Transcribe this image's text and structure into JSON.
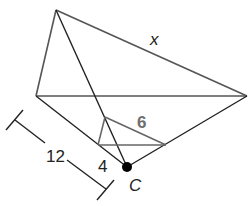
{
  "diagram": {
    "type": "geometry-dilation",
    "colors": {
      "large_triangle_stroke": "#555555",
      "small_triangle_stroke": "#666666",
      "ray_stroke": "#222222",
      "label_dark": "#222222",
      "label_gray": "#6e6e6e"
    },
    "points": {
      "large_top": [
        56,
        10
      ],
      "large_left": [
        36,
        96
      ],
      "large_right": [
        247,
        96
      ],
      "small_top": [
        105,
        117
      ],
      "small_left": [
        98,
        145
      ],
      "small_right": [
        166,
        145
      ],
      "center_C": [
        127,
        167
      ]
    },
    "labels": {
      "x": "x",
      "six": "6",
      "twelve": "12",
      "four": "4",
      "center": "C"
    },
    "measurements": {
      "large_side": "x",
      "small_side": "6",
      "distance_C_to_large": "12",
      "distance_C_to_small": "4"
    }
  }
}
